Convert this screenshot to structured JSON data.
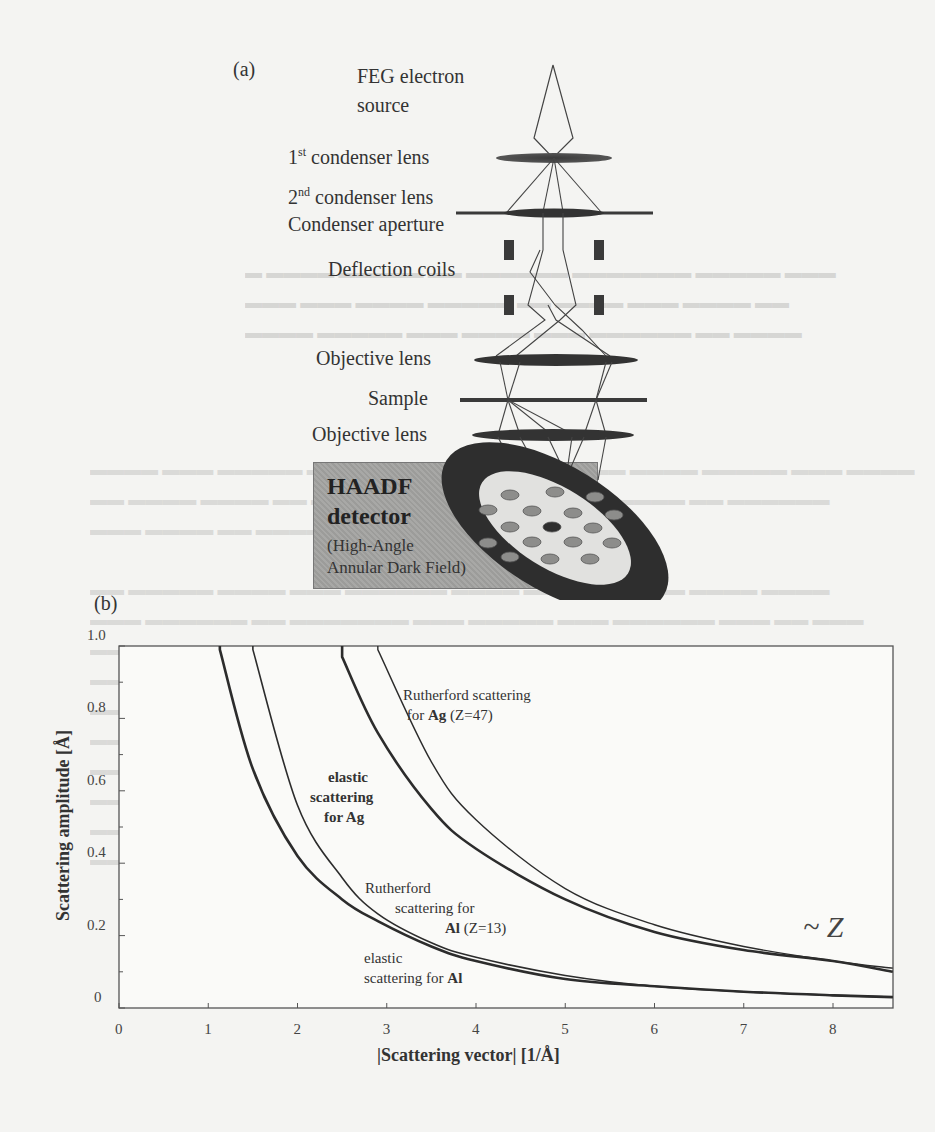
{
  "panel_a": {
    "label": "(a)",
    "components": {
      "source": [
        "FEG electron",
        "source"
      ],
      "condenser1": {
        "num": "1",
        "sup": "st",
        "text": " condenser lens"
      },
      "condenser2": {
        "num": "2",
        "sup": "nd",
        "text": " condenser lens"
      },
      "aperture": "Condenser aperture",
      "deflection": "Deflection coils",
      "objective_upper": "Objective lens",
      "sample": "Sample",
      "objective_lower": "Objective lens"
    },
    "detector": {
      "title1": "HAADF",
      "title2": "detector",
      "sub1": "(High-Angle",
      "sub2": "Annular Dark Field)"
    }
  },
  "panel_b": {
    "label": "(b)",
    "annotation": "~ Z",
    "curve_labels": {
      "ag_rutherford": [
        "Rutherford scattering",
        "for ",
        "Ag",
        " (Z=47)"
      ],
      "ag_elastic": [
        "elastic",
        "scattering",
        "for ",
        "Ag"
      ],
      "al_rutherford": [
        "Rutherford",
        "scattering for",
        "Al",
        " (Z=13)"
      ],
      "al_elastic": [
        "elastic",
        "scattering for ",
        "Al"
      ]
    }
  },
  "chart_data": {
    "type": "line",
    "title": "",
    "xlabel": "|Scattering vector| [1/Å]",
    "ylabel": "Scattering amplitude [Å]",
    "xlim": [
      0,
      8.67
    ],
    "ylim": [
      0,
      1.0
    ],
    "xticks": [
      "0",
      "1",
      "2",
      "3",
      "4",
      "5",
      "6",
      "7",
      "8"
    ],
    "yticks": [
      "0",
      "0.2",
      "0.4",
      "0.6",
      "0.8",
      "1.0"
    ],
    "grid": false,
    "legend": "inline labels",
    "annotation": "~ Z",
    "x": [
      1.13,
      1.5,
      2.0,
      2.5,
      2.9,
      3.5,
      4.0,
      5.0,
      6.0,
      7.0,
      8.0,
      8.67
    ],
    "series": [
      {
        "name": "Rutherford scattering for Ag (Z=47)",
        "values": [
          null,
          null,
          null,
          null,
          0.99,
          0.68,
          0.52,
          0.33,
          0.23,
          0.17,
          0.13,
          0.11
        ]
      },
      {
        "name": "elastic scattering for Ag",
        "values": [
          null,
          null,
          null,
          0.97,
          0.76,
          0.55,
          0.44,
          0.3,
          0.21,
          0.16,
          0.13,
          0.1
        ]
      },
      {
        "name": "Rutherford scattering for Al (Z=13)",
        "values": [
          null,
          0.99,
          0.56,
          0.36,
          0.26,
          0.18,
          0.14,
          0.09,
          0.06,
          0.045,
          0.035,
          0.03
        ]
      },
      {
        "name": "elastic scattering for Al",
        "values": [
          0.99,
          0.66,
          0.42,
          0.3,
          0.24,
          0.17,
          0.13,
          0.08,
          0.06,
          0.045,
          0.035,
          0.03
        ]
      }
    ]
  }
}
